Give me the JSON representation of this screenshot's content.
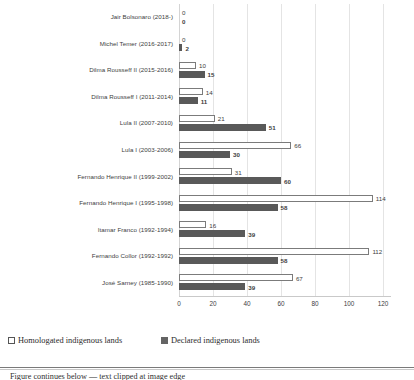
{
  "chart_data": {
    "type": "bar",
    "orientation": "horizontal",
    "title": "",
    "xlabel": "",
    "ylabel": "",
    "xlim": [
      0,
      120
    ],
    "xticks": [
      0,
      20,
      40,
      60,
      80,
      100,
      120
    ],
    "grid": true,
    "legend_position": "bottom-left",
    "categories": [
      "Jair Bolsonaro (2018-)",
      "Michel Temer (2016-2017)",
      "Dilma Rousseff II (2015-2016)",
      "Dilma Rousseff I (2011-2014)",
      "Lula II (2007-2010)",
      "Lula I (2003-2006)",
      "Fernando Henrique II (1999-2002)",
      "Fernando Henrique I (1995-1998)",
      "Itamar Franco (1992-1994)",
      "Fernando Collor (1992-1992)",
      "José Sarney (1985-1990)"
    ],
    "series": [
      {
        "name": "Homologated indigenous lands",
        "color": "#ffffff",
        "border_color": "#7b7b7b",
        "values": [
          0,
          0,
          10,
          14,
          21,
          66,
          31,
          114,
          16,
          112,
          67
        ]
      },
      {
        "name": "Declared indigenous lands",
        "color": "#595959",
        "border_color": "#595959",
        "values": [
          0,
          2,
          15,
          11,
          51,
          30,
          60,
          58,
          39,
          58,
          39
        ]
      }
    ]
  },
  "legend": {
    "items": [
      {
        "label": "Homologated indigenous lands",
        "swatch": "homolog"
      },
      {
        "label": "Declared indigenous lands",
        "swatch": "declared"
      }
    ]
  },
  "footer": {
    "cut_caption": "Figure continues below — text clipped at image edge"
  }
}
